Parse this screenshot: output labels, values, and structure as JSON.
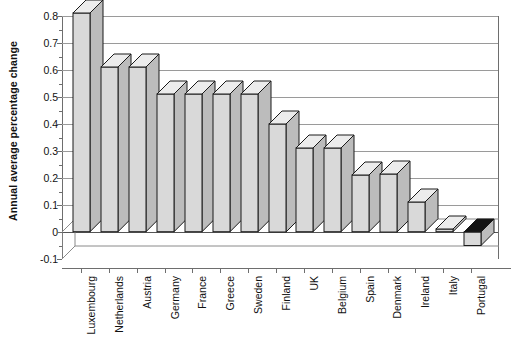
{
  "chart_data": {
    "type": "bar",
    "title": "",
    "xlabel": "",
    "ylabel": "Annual average percentage change",
    "categories": [
      "Luxembourg",
      "Netherlands",
      "Austria",
      "Germany",
      "France",
      "Greece",
      "Sweden",
      "Finland",
      "UK",
      "Belgium",
      "Spain",
      "Denmark",
      "Ireland",
      "Italy",
      "Portugal"
    ],
    "values": [
      0.81,
      0.61,
      0.61,
      0.51,
      0.51,
      0.51,
      0.51,
      0.4,
      0.31,
      0.31,
      0.21,
      0.215,
      0.11,
      0.01,
      -0.05
    ],
    "ylim": [
      -0.1,
      0.8
    ],
    "ytick_labels": [
      "0.8",
      "0.7",
      "0.6",
      "0.5",
      "0.4",
      "0.3",
      "0.2",
      "0.1",
      "0",
      "-0.1"
    ],
    "ytick_values": [
      0.8,
      0.7,
      0.6,
      0.5,
      0.4,
      0.3,
      0.2,
      0.1,
      0,
      -0.1
    ],
    "grid": true,
    "legend": "none",
    "style": "3d-column",
    "bar_color": "#d8d8d8",
    "bar_edge_color": "#1a1a1a",
    "negative_top_color": "#141414",
    "grid_color": "#9a9a9a",
    "background": "#ffffff"
  }
}
